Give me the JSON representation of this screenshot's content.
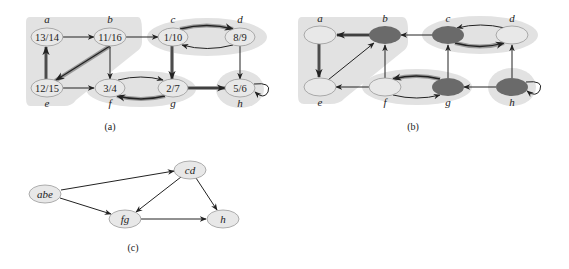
{
  "colors": {
    "region": "#e2e2e2",
    "node_light": "#e8e8e8",
    "node_dark": "#6a6a6a",
    "edge": "#222222",
    "tree_edge_shadow": "#9a9a9a"
  },
  "panel_a": {
    "caption": "(a)",
    "nodes": [
      {
        "id": "a",
        "label": "a",
        "value": "13/14"
      },
      {
        "id": "b",
        "label": "b",
        "value": "11/16"
      },
      {
        "id": "c",
        "label": "c",
        "value": "1/10"
      },
      {
        "id": "d",
        "label": "d",
        "value": "8/9"
      },
      {
        "id": "e",
        "label": "e",
        "value": "12/15"
      },
      {
        "id": "f",
        "label": "f",
        "value": "3/4"
      },
      {
        "id": "g",
        "label": "g",
        "value": "2/7"
      },
      {
        "id": "h",
        "label": "h",
        "value": "5/6"
      }
    ],
    "edges": [
      {
        "from": "a",
        "to": "b",
        "tree": false
      },
      {
        "from": "b",
        "to": "c",
        "tree": false
      },
      {
        "from": "b",
        "to": "e",
        "tree": true
      },
      {
        "from": "b",
        "to": "f",
        "tree": false
      },
      {
        "from": "c",
        "to": "d",
        "tree": true
      },
      {
        "from": "d",
        "to": "c",
        "tree": false
      },
      {
        "from": "c",
        "to": "g",
        "tree": true
      },
      {
        "from": "d",
        "to": "h",
        "tree": false
      },
      {
        "from": "e",
        "to": "a",
        "tree": true
      },
      {
        "from": "e",
        "to": "f",
        "tree": false
      },
      {
        "from": "f",
        "to": "g",
        "tree": false
      },
      {
        "from": "g",
        "to": "f",
        "tree": true
      },
      {
        "from": "g",
        "to": "h",
        "tree": true
      },
      {
        "from": "h",
        "to": "h",
        "tree": false
      }
    ],
    "components": [
      [
        "a",
        "b",
        "e"
      ],
      [
        "c",
        "d"
      ],
      [
        "f",
        "g"
      ],
      [
        "h"
      ]
    ]
  },
  "panel_b": {
    "caption": "(b)",
    "nodes": [
      {
        "id": "a",
        "label": "a",
        "dark": false
      },
      {
        "id": "b",
        "label": "b",
        "dark": true
      },
      {
        "id": "c",
        "label": "c",
        "dark": true
      },
      {
        "id": "d",
        "label": "d",
        "dark": false
      },
      {
        "id": "e",
        "label": "e",
        "dark": false
      },
      {
        "id": "f",
        "label": "f",
        "dark": false
      },
      {
        "id": "g",
        "label": "g",
        "dark": true
      },
      {
        "id": "h",
        "label": "h",
        "dark": true
      }
    ],
    "edges": [
      {
        "from": "b",
        "to": "a",
        "tree": true
      },
      {
        "from": "c",
        "to": "b",
        "tree": false
      },
      {
        "from": "e",
        "to": "b",
        "tree": false
      },
      {
        "from": "f",
        "to": "b",
        "tree": false
      },
      {
        "from": "d",
        "to": "c",
        "tree": false
      },
      {
        "from": "c",
        "to": "d",
        "tree": true
      },
      {
        "from": "h",
        "to": "d",
        "tree": false
      },
      {
        "from": "a",
        "to": "e",
        "tree": true
      },
      {
        "from": "f",
        "to": "e",
        "tree": false
      },
      {
        "from": "g",
        "to": "f",
        "tree": true
      },
      {
        "from": "f",
        "to": "g",
        "tree": false
      },
      {
        "from": "g",
        "to": "c",
        "tree": false
      },
      {
        "from": "h",
        "to": "g",
        "tree": false
      },
      {
        "from": "h",
        "to": "h",
        "tree": false
      }
    ]
  },
  "panel_c": {
    "caption": "(c)",
    "nodes": [
      {
        "id": "abe",
        "label": "abe"
      },
      {
        "id": "cd",
        "label": "cd"
      },
      {
        "id": "fg",
        "label": "fg"
      },
      {
        "id": "h",
        "label": "h"
      }
    ],
    "edges": [
      {
        "from": "abe",
        "to": "cd"
      },
      {
        "from": "abe",
        "to": "fg"
      },
      {
        "from": "cd",
        "to": "fg"
      },
      {
        "from": "cd",
        "to": "h"
      },
      {
        "from": "fg",
        "to": "h"
      }
    ]
  }
}
